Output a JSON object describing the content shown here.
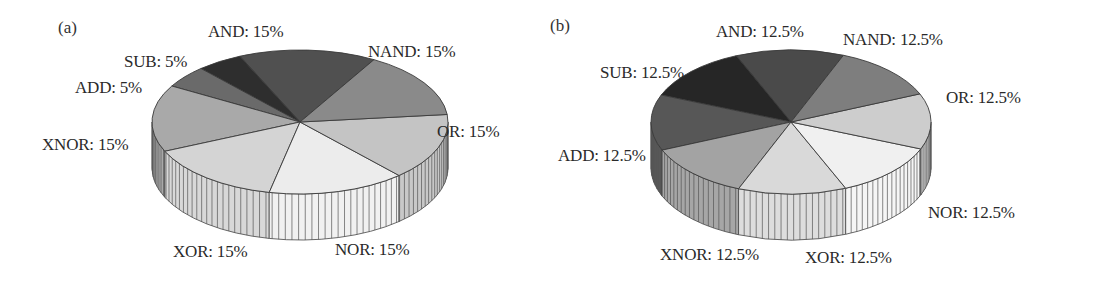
{
  "chart_data": [
    {
      "type": "pie",
      "style": "3d",
      "panel_label": "(a)",
      "title": "",
      "center": [
        300,
        122
      ],
      "rx": 148,
      "ry": 72,
      "depth": 46,
      "start_angle_deg": 30,
      "slices": [
        {
          "name": "AND",
          "value": 15,
          "label": "AND: 15%",
          "color": "#505050",
          "label_pos": [
            208,
            22
          ]
        },
        {
          "name": "SUB",
          "value": 5,
          "label": "SUB: 5%",
          "color": "#2e2e2e",
          "label_pos": [
            124,
            52
          ]
        },
        {
          "name": "ADD",
          "value": 5,
          "label": "ADD: 5%",
          "color": "#6a6a6a",
          "label_pos": [
            75,
            78
          ]
        },
        {
          "name": "XNOR",
          "value": 15,
          "label": "XNOR: 15%",
          "color": "#a9a9a9",
          "label_pos": [
            42,
            135
          ]
        },
        {
          "name": "XOR",
          "value": 15,
          "label": "XOR: 15%",
          "color": "#d4d4d4",
          "label_pos": [
            173,
            242
          ]
        },
        {
          "name": "NOR",
          "value": 15,
          "label": "NOR: 15%",
          "color": "#ececec",
          "label_pos": [
            335,
            240
          ]
        },
        {
          "name": "OR",
          "value": 15,
          "label": "OR: 15%",
          "color": "#c4c4c4",
          "label_pos": [
            437,
            122
          ]
        },
        {
          "name": "NAND",
          "value": 15,
          "label": "NAND: 15%",
          "color": "#8a8a8a",
          "label_pos": [
            368,
            42
          ]
        }
      ]
    },
    {
      "type": "pie",
      "style": "3d",
      "panel_label": "(b)",
      "title": "",
      "center": [
        241,
        122
      ],
      "rx": 140,
      "ry": 72,
      "depth": 46,
      "start_angle_deg": 22,
      "slices": [
        {
          "name": "AND",
          "value": 12.5,
          "label": "AND: 12.5%",
          "color": "#4a4a4a",
          "label_pos": [
            166,
            22
          ]
        },
        {
          "name": "SUB",
          "value": 12.5,
          "label": "SUB: 12.5%",
          "color": "#262626",
          "label_pos": [
            50,
            63
          ]
        },
        {
          "name": "ADD",
          "value": 12.5,
          "label": "ADD: 12.5%",
          "color": "#575757",
          "label_pos": [
            8,
            146
          ]
        },
        {
          "name": "XNOR",
          "value": 12.5,
          "label": "XNOR: 12.5%",
          "color": "#a3a3a3",
          "label_pos": [
            110,
            245
          ]
        },
        {
          "name": "XOR",
          "value": 12.5,
          "label": "XOR: 12.5%",
          "color": "#d9d9d9",
          "label_pos": [
            255,
            248
          ]
        },
        {
          "name": "NOR",
          "value": 12.5,
          "label": "NOR: 12.5%",
          "color": "#f0f0f0",
          "label_pos": [
            378,
            203
          ]
        },
        {
          "name": "OR",
          "value": 12.5,
          "label": "OR: 12.5%",
          "color": "#cdcdcd",
          "label_pos": [
            396,
            88
          ]
        },
        {
          "name": "NAND",
          "value": 12.5,
          "label": "NAND: 12.5%",
          "color": "#7e7e7e",
          "label_pos": [
            293,
            30
          ]
        }
      ]
    }
  ]
}
